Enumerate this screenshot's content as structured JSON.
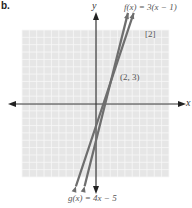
{
  "problem_label": "b.",
  "points_label": "[2]",
  "chart_data": {
    "type": "line",
    "title": "",
    "xlabel": "x",
    "ylabel": "y",
    "xlim": [
      -10,
      10
    ],
    "ylim": [
      -10,
      10
    ],
    "grid": true,
    "series": [
      {
        "name": "f(x) = 3(x − 1)",
        "slope": 3,
        "intercept": -3
      },
      {
        "name": "g(x) = 4x − 5",
        "slope": 4,
        "intercept": -5
      }
    ],
    "annotations": [
      {
        "text": "(2, 3)",
        "x": 2,
        "y": 3
      }
    ],
    "intersection": {
      "x": 2,
      "y": 3
    }
  },
  "labels": {
    "f": "f(x) = 3(x − 1)",
    "g": "g(x) = 4x − 5",
    "point": "(2, 3)",
    "x_axis": "x",
    "y_axis": "y"
  },
  "colors": {
    "grid_bg": "#e6e6e6",
    "grid_line": "#f7f7f7",
    "axis": "#333333",
    "line": "#6e6e6e"
  }
}
